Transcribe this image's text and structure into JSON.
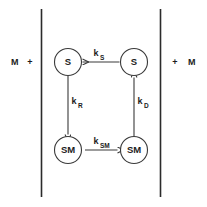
{
  "figure": {
    "type": "reaction-scheme-diagram",
    "background_color": "#ffffff",
    "stroke_color": "#3a3a3a",
    "membrane_color": "#2b2b2b",
    "text_color": "#1c1c1c"
  },
  "membrane": {
    "left_line_label": "membrane-boundary-left",
    "right_line_label": "membrane-boundary-right"
  },
  "bulk": {
    "left_species": "M",
    "left_plus": "+",
    "right_plus": "+",
    "right_species": "M"
  },
  "nodes": {
    "top_left": "S",
    "top_right": "S",
    "bottom_left": "SM",
    "bottom_right": "SM"
  },
  "rates": {
    "top": {
      "base": "k",
      "sub": "S"
    },
    "left": {
      "base": "k",
      "sub": "R"
    },
    "right": {
      "base": "k",
      "sub": "D"
    },
    "bottom": {
      "base": "k",
      "sub": "SM"
    }
  },
  "arrows": {
    "top": {
      "name": "arrow-top-right-to-left",
      "direction": "left"
    },
    "left": {
      "name": "arrow-left-down",
      "direction": "down"
    },
    "right": {
      "name": "arrow-right-up",
      "direction": "up"
    },
    "bottom": {
      "name": "arrow-bottom-left-to-right",
      "direction": "right"
    }
  }
}
